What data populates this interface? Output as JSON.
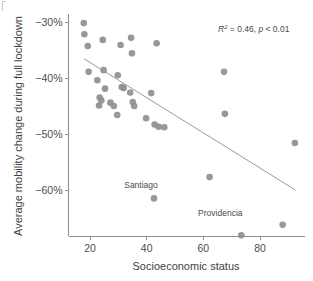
{
  "chart_data": {
    "type": "scatter",
    "title": "",
    "xlabel": "Socioeconomic status",
    "ylabel": "Average mobility change during full lockdown",
    "xlim": [
      14,
      97
    ],
    "ylim": [
      -70.5,
      -28.5
    ],
    "xticks": [
      20,
      40,
      60,
      80
    ],
    "xtick_labels": [
      "20",
      "40",
      "60",
      "80"
    ],
    "yticks": [
      -30,
      -40,
      -50,
      -60
    ],
    "ytick_labels": [
      "−30%",
      "−40%",
      "−50%",
      "−60%"
    ],
    "grid": false,
    "legend": false,
    "point_color": "#8f8f8f",
    "line_color": "#9a9a9a",
    "axis_color": "#8d8d8d",
    "text_color": "#4d4d4d",
    "annotation": {
      "r_squared_symbol": "R",
      "r_squared_exponent": "2",
      "r_squared_text": " = 0.46, ",
      "p_symbol": "p",
      "p_text": " < 0.01",
      "full_text": "R2 = 0.46, p < 0.01"
    },
    "trend_line": {
      "x_start": 18.0,
      "y_start": -36.6,
      "x_end": 92.5,
      "y_end": -60.0
    },
    "point_labels": [
      {
        "text": "Santiago",
        "x": 38.0,
        "y": -59.6
      },
      {
        "text": "Providencia",
        "x": 66.0,
        "y": -64.6
      }
    ],
    "points": [
      {
        "x": 17.8,
        "y": -30.2
      },
      {
        "x": 18.0,
        "y": -32.2
      },
      {
        "x": 19.2,
        "y": -34.3
      },
      {
        "x": 24.5,
        "y": -33.2
      },
      {
        "x": 34.5,
        "y": -32.8
      },
      {
        "x": 30.8,
        "y": -34.1
      },
      {
        "x": 43.5,
        "y": -33.8
      },
      {
        "x": 34.8,
        "y": -35.6
      },
      {
        "x": 19.5,
        "y": -38.9
      },
      {
        "x": 24.8,
        "y": -38.6
      },
      {
        "x": 29.8,
        "y": -39.5
      },
      {
        "x": 22.6,
        "y": -40.4
      },
      {
        "x": 31.2,
        "y": -41.6
      },
      {
        "x": 31.9,
        "y": -41.8
      },
      {
        "x": 34.2,
        "y": -42.6
      },
      {
        "x": 25.3,
        "y": -41.9
      },
      {
        "x": 41.6,
        "y": -42.7
      },
      {
        "x": 23.4,
        "y": -43.5
      },
      {
        "x": 24.0,
        "y": -44.0
      },
      {
        "x": 27.2,
        "y": -44.4
      },
      {
        "x": 23.2,
        "y": -44.9
      },
      {
        "x": 28.4,
        "y": -45.0
      },
      {
        "x": 35.1,
        "y": -44.3
      },
      {
        "x": 35.6,
        "y": -45.0
      },
      {
        "x": 29.6,
        "y": -46.6
      },
      {
        "x": 39.8,
        "y": -47.2
      },
      {
        "x": 42.8,
        "y": -48.3
      },
      {
        "x": 44.2,
        "y": -48.7
      },
      {
        "x": 46.2,
        "y": -48.8
      },
      {
        "x": 67.3,
        "y": -38.9
      },
      {
        "x": 67.6,
        "y": -46.4
      },
      {
        "x": 92.3,
        "y": -51.6
      },
      {
        "x": 62.2,
        "y": -57.7
      },
      {
        "x": 42.6,
        "y": -61.5
      },
      {
        "x": 88.0,
        "y": -66.2
      },
      {
        "x": 73.4,
        "y": -68.1
      }
    ]
  }
}
